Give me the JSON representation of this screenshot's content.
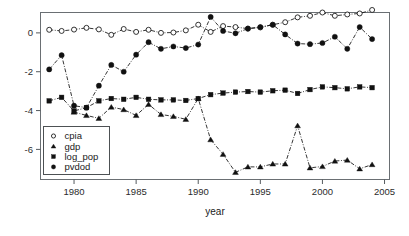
{
  "chart_data": {
    "type": "line",
    "title": "",
    "subtitle": "",
    "xlabel": "year",
    "ylabel": "",
    "xlim": [
      1977.3,
      2005.4
    ],
    "ylim": [
      -7.55,
      1.05
    ],
    "xticks": [
      1980,
      1985,
      1990,
      1995,
      2000,
      2005
    ],
    "xtick_labels": [
      "1980",
      "1985",
      "1990",
      "1995",
      "2000",
      "2005"
    ],
    "yticks": [
      0,
      -2,
      -4,
      -6
    ],
    "ytick_labels": [
      "0",
      "-2",
      "-4",
      "-6"
    ],
    "grid": false,
    "legend_position": "lower-left",
    "line_style": "dash-dot",
    "line_color": "#111111",
    "x": [
      1978,
      1979,
      1980,
      1981,
      1982,
      1983,
      1984,
      1985,
      1986,
      1987,
      1988,
      1989,
      1990,
      1991,
      1992,
      1993,
      1994,
      1995,
      1996,
      1997,
      1998,
      1999,
      2000,
      2001,
      2002,
      2003,
      2004
    ],
    "series": [
      {
        "name": "cpia",
        "marker": "open-circle",
        "values": [
          0.16,
          0.1,
          0.17,
          0.26,
          0.18,
          -0.1,
          0.2,
          0.05,
          0.16,
          0.0,
          0.02,
          0.13,
          0.42,
          0.05,
          0.35,
          0.3,
          0.22,
          0.28,
          0.42,
          0.55,
          0.8,
          0.88,
          1.05,
          0.88,
          0.95,
          1.0,
          1.18
        ]
      },
      {
        "name": "gdp",
        "marker": "filled-triangle",
        "values": [
          null,
          null,
          -4.08,
          -4.25,
          -4.4,
          -3.82,
          -3.95,
          -4.25,
          -3.68,
          -4.2,
          -4.3,
          -4.45,
          -3.38,
          -5.5,
          -6.25,
          -7.18,
          -6.9,
          -6.9,
          -6.75,
          -6.75,
          -4.78,
          -6.95,
          -6.88,
          -6.6,
          -6.55,
          -7.0,
          -6.78
        ]
      },
      {
        "name": "log_pop",
        "marker": "filled-square",
        "values": [
          -3.5,
          -3.32,
          -4.02,
          -3.85,
          -3.5,
          -3.38,
          -3.42,
          -3.32,
          -3.42,
          -3.45,
          -3.45,
          -3.48,
          -3.38,
          -3.18,
          -3.1,
          -3.05,
          -3.02,
          -3.05,
          -2.98,
          -2.95,
          -3.12,
          -2.92,
          -2.78,
          -2.82,
          -2.88,
          -2.78,
          -2.82
        ]
      },
      {
        "name": "pvdod",
        "marker": "filled-circle",
        "values": [
          -1.88,
          -1.15,
          -3.75,
          -3.85,
          -2.72,
          -1.65,
          -2.0,
          -1.12,
          -0.48,
          -0.82,
          -0.7,
          -0.78,
          -0.6,
          0.82,
          0.1,
          -0.02,
          0.22,
          0.3,
          0.42,
          -0.08,
          -0.55,
          -0.58,
          -0.52,
          -0.2,
          -0.82,
          0.3,
          -0.32
        ]
      }
    ]
  },
  "legend": {
    "entries": [
      {
        "label": "cpia",
        "marker": "open-circle"
      },
      {
        "label": "gdp",
        "marker": "filled-triangle"
      },
      {
        "label": "log_pop",
        "marker": "filled-square"
      },
      {
        "label": "pvdod",
        "marker": "filled-circle"
      }
    ]
  }
}
